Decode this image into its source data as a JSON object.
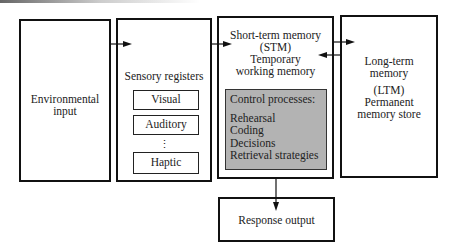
{
  "boxes": {
    "environmental": {
      "lines": [
        "Environmental",
        "input"
      ]
    },
    "sensory": {
      "title": "Sensory registers",
      "items": [
        "Visual",
        "Auditory",
        "Haptic"
      ],
      "ellipsis": "⋮"
    },
    "stm": {
      "lines": [
        "Short-term memory",
        "(STM)",
        "Temporary",
        "working memory"
      ],
      "control": {
        "title": "Control processes:",
        "items": [
          "Rehearsal",
          "Coding",
          "Decisions",
          "Retrieval strategies"
        ]
      }
    },
    "ltm": {
      "lines": [
        "Long-term",
        "memory",
        "(LTM)",
        "Permanent",
        "memory store"
      ]
    },
    "response": {
      "label": "Response output"
    }
  },
  "colors": {
    "border": "#111111",
    "control_fill": "#b3b3b3"
  }
}
